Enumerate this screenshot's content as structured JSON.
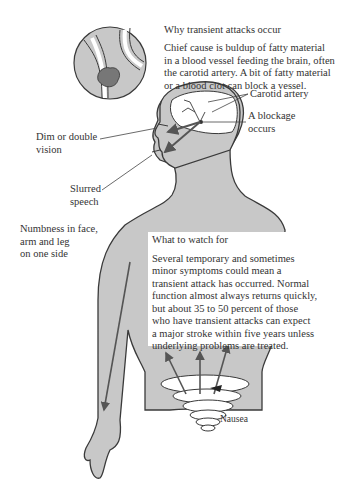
{
  "figure": {
    "why": {
      "heading": "Why transient attacks occur",
      "lines": [
        "Chief cause is buldup of fatty material",
        "in a blood vessel feeding the brain, often",
        "the carotid artery. A bit of fatty material",
        "or a blood clot can block a vessel."
      ]
    },
    "labels": {
      "carotid": "Carotid artery",
      "blockage_1": "A blockage",
      "blockage_2": "occurs",
      "vision_1": "Dim or double",
      "vision_2": "vision",
      "speech_1": "Slurred",
      "speech_2": "speech",
      "numb_1": "Numbness in face,",
      "numb_2": "arm and leg",
      "numb_3": "on one side",
      "nausea": "Nausea"
    },
    "watch": {
      "heading": "What to watch for",
      "lines": [
        "Several temporary and sometimes",
        "minor symptoms could mean a",
        "transient attack has occurred. Normal",
        "function almost always returns quickly,",
        "but about 35 to 50 percent of those",
        "who have transient attacks can expect",
        "a major stroke within five years unless",
        "underlying problems are treated."
      ]
    },
    "colors": {
      "body_fill": "#c8c8c8",
      "outline": "#3a3a3a",
      "arrow": "#555555",
      "clot": "#777777"
    }
  }
}
